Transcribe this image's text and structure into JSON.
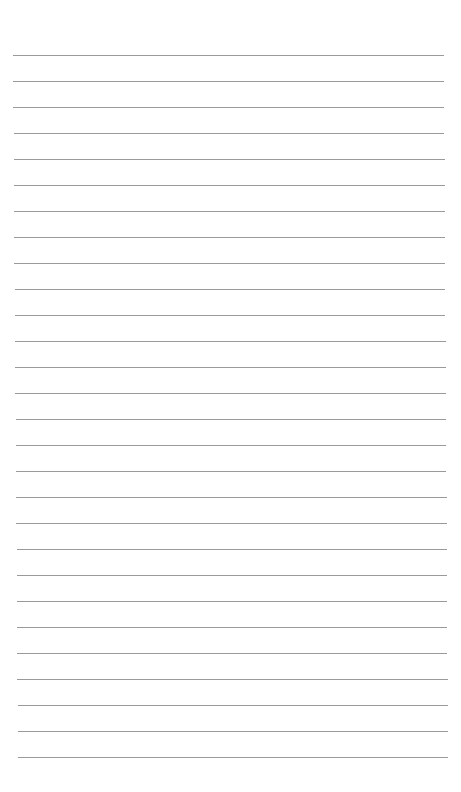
{
  "page": {
    "type": "ruled-notebook-paper",
    "background_color": "#ffffff",
    "line_color": "#9a9a9a",
    "line_count": 28,
    "first_line_y": 55,
    "line_spacing": 26,
    "line_left_top": 13,
    "line_right_top": 444,
    "line_left_bottom": 18,
    "line_right_bottom": 448
  }
}
